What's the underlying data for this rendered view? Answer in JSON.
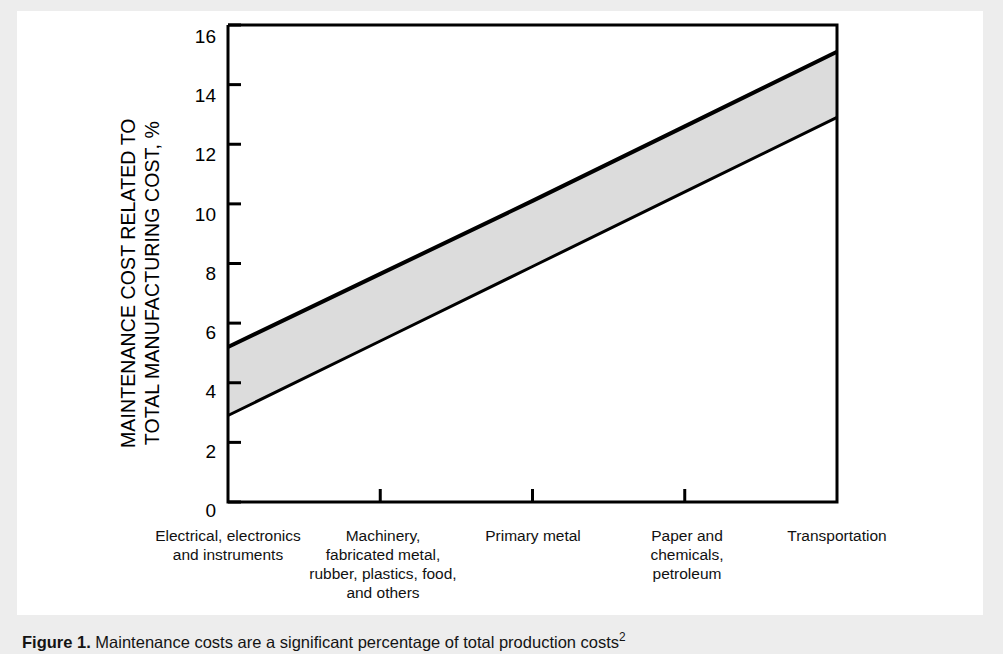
{
  "figure": {
    "caption_label": "Figure 1.",
    "caption_text": "Maintenance costs are a significant percentage of total production costs",
    "caption_superscript": "2"
  },
  "chart_data": {
    "type": "area",
    "title": "",
    "xlabel": "",
    "ylabel": "MAINTENANCE COST RELATED TO\nTOTAL MANUFACTURING COST, %",
    "ylim": [
      0,
      16
    ],
    "yticks": [
      0,
      2,
      4,
      6,
      8,
      10,
      12,
      14,
      16
    ],
    "ytick_labels": [
      "0",
      "2",
      "4",
      "6",
      "8",
      "10",
      "12",
      "14",
      "16"
    ],
    "grid": false,
    "legend": "none",
    "x": [
      0,
      1,
      2,
      3,
      4
    ],
    "categories": [
      "Electrical, electronics\nand instruments",
      "Machinery,\nfabricated metal,\nrubber, plastics, food,\nand others",
      "Primary metal",
      "Paper and\nchemicals,\npetroleum",
      "Transportation"
    ],
    "series": [
      {
        "name": "Upper bound",
        "values": [
          5.2,
          7.65,
          10.1,
          12.6,
          15.1
        ]
      },
      {
        "name": "Lower bound",
        "values": [
          2.9,
          5.4,
          7.9,
          10.4,
          12.9
        ]
      }
    ],
    "band_fill_color": "#dcdcdc",
    "band_edge_color": "#000000",
    "axis_color": "#000000"
  }
}
